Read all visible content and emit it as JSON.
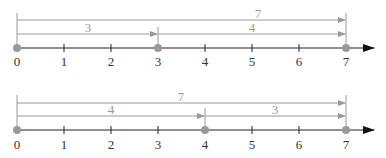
{
  "diagram": {
    "colors": {
      "axis": "#222222",
      "arrow": "#9a9a9a",
      "dot": "#9a9a9a",
      "label": "#333333",
      "seg_label": "#9a9a9a"
    },
    "number_lines": [
      {
        "ticks": [
          "0",
          "1",
          "2",
          "3",
          "4",
          "5",
          "6",
          "7"
        ],
        "total_label": "7",
        "first_label": "3",
        "second_label": "4",
        "points": [
          0,
          3,
          7
        ]
      },
      {
        "ticks": [
          "0",
          "1",
          "2",
          "3",
          "4",
          "5",
          "6",
          "7"
        ],
        "total_label": "7",
        "first_label": "4",
        "second_label": "3",
        "points": [
          0,
          4,
          7
        ]
      }
    ]
  }
}
